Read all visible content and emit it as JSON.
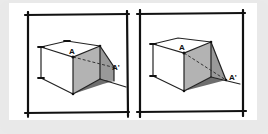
{
  "figure": {
    "panels": [
      {
        "id": "left",
        "labels": {
          "point": "A",
          "point_prime": "A'"
        }
      },
      {
        "id": "right",
        "labels": {
          "point": "A",
          "point_prime": "A'"
        }
      }
    ],
    "colors": {
      "background": "#e9e9e9",
      "panel": "#ffffff",
      "ink": "#111111",
      "shadow_light": "#b8b8b8",
      "shadow_mid": "#9a9a9a",
      "shadow_dark": "#6e6e6e"
    }
  }
}
